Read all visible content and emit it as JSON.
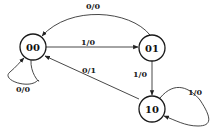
{
  "diagram": {
    "type": "finite-state-machine",
    "states": [
      {
        "id": "s00",
        "label": "00",
        "cx": 33,
        "cy": 47,
        "r": 13
      },
      {
        "id": "s01",
        "label": "01",
        "cx": 152,
        "cy": 48,
        "r": 13
      },
      {
        "id": "s10",
        "label": "10",
        "cx": 152,
        "cy": 109,
        "r": 13
      }
    ],
    "transitions": [
      {
        "from": "01",
        "to": "00",
        "label": "0/0"
      },
      {
        "from": "00",
        "to": "01",
        "label": "1/0"
      },
      {
        "from": "01",
        "to": "10",
        "label": "1/0"
      },
      {
        "from": "10",
        "to": "00",
        "label": "0/1"
      },
      {
        "from": "00",
        "to": "00",
        "label": "0/0"
      },
      {
        "from": "10",
        "to": "10",
        "label": "1/0"
      }
    ],
    "colors": {
      "stroke": "#1a1a1a",
      "background": "#ffffff"
    }
  }
}
